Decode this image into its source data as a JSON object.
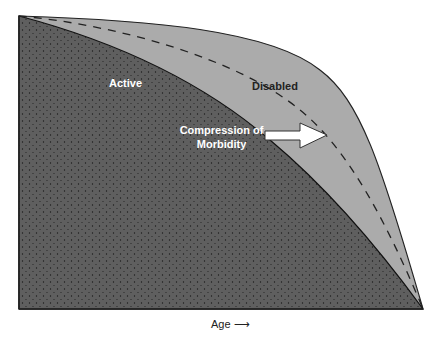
{
  "diagram": {
    "regions": [
      {
        "name": "active",
        "label": "Active",
        "color": "#5f5f5f"
      },
      {
        "name": "disabled",
        "label": "Disabled",
        "color": "#ababab"
      }
    ],
    "annotation": {
      "line1": "Compression of",
      "line2": "Morbidity"
    },
    "x_axis_label": "Age",
    "x_axis_arrow": "⟶",
    "curves": {
      "total_survival": "solid outer curve",
      "active_survival": "solid inner curve",
      "shifted_active": "dashed curve"
    }
  }
}
